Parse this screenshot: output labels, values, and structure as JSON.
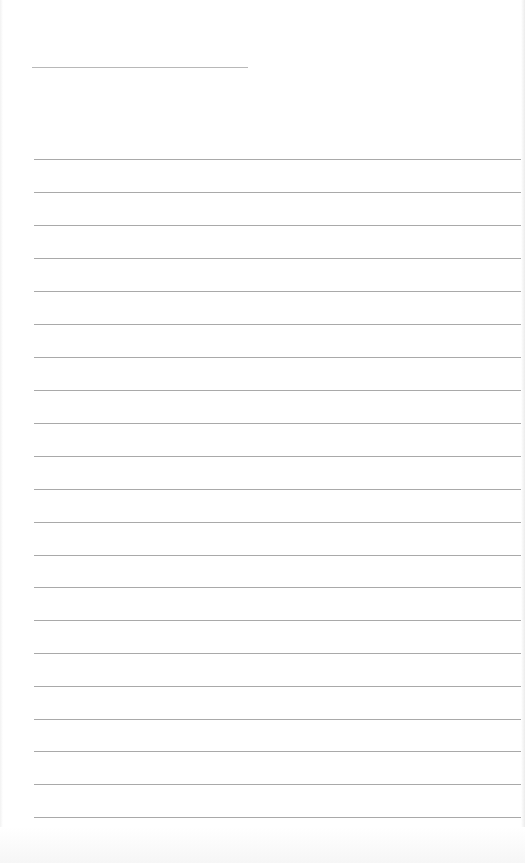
{
  "document": {
    "type": "lined-paper",
    "title_line": {
      "label": ""
    },
    "rules": [
      {
        "y": 159
      },
      {
        "y": 192
      },
      {
        "y": 225
      },
      {
        "y": 258
      },
      {
        "y": 291
      },
      {
        "y": 324
      },
      {
        "y": 357
      },
      {
        "y": 390
      },
      {
        "y": 423
      },
      {
        "y": 456
      },
      {
        "y": 489
      },
      {
        "y": 522
      },
      {
        "y": 555
      },
      {
        "y": 587
      },
      {
        "y": 620
      },
      {
        "y": 653
      },
      {
        "y": 686
      },
      {
        "y": 719
      },
      {
        "y": 751
      },
      {
        "y": 784
      },
      {
        "y": 817
      }
    ],
    "line_color": "#a9a9a9"
  }
}
